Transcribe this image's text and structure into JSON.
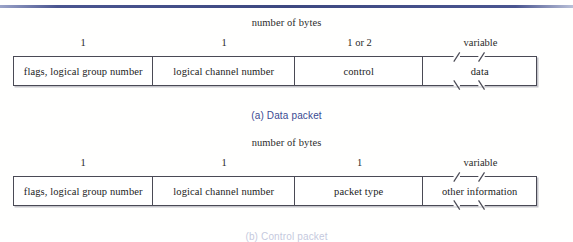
{
  "page": {
    "background_color": "#fffffe",
    "rule_color": "#3d4880",
    "caption_color": "#3a4a92",
    "box_border_color": "#4a4a55"
  },
  "figures": [
    {
      "id": "data-packet",
      "bytes_title": "number of bytes",
      "caption": "(a) Data packet",
      "fields": [
        {
          "label": "flags, logical group number",
          "size": "1",
          "width_px": 140,
          "truncated": false
        },
        {
          "label": "logical channel number",
          "size": "1",
          "width_px": 142,
          "truncated": false
        },
        {
          "label": "control",
          "size": "1 or 2",
          "width_px": 129,
          "truncated": false
        },
        {
          "label": "data",
          "size": "variable",
          "width_px": 113,
          "truncated": true
        }
      ]
    },
    {
      "id": "control-packet",
      "bytes_title": "number of bytes",
      "caption": "(b) Control packet",
      "fields": [
        {
          "label": "flags, logical group number",
          "size": "1",
          "width_px": 140,
          "truncated": false
        },
        {
          "label": "logical channel number",
          "size": "1",
          "width_px": 142,
          "truncated": false
        },
        {
          "label": "packet type",
          "size": "1",
          "width_px": 129,
          "truncated": false
        },
        {
          "label": "other information",
          "size": "variable",
          "width_px": 113,
          "truncated": true
        }
      ]
    }
  ]
}
